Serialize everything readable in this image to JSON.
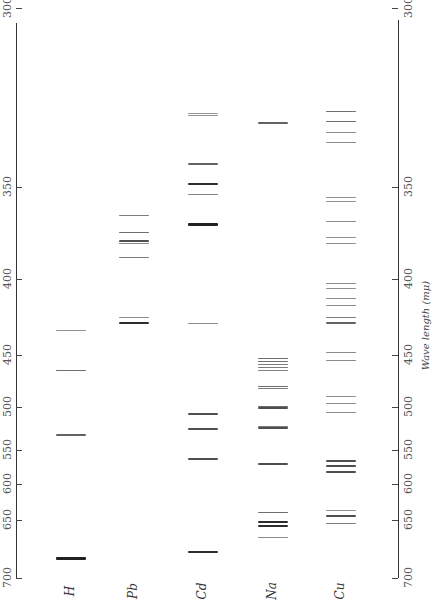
{
  "chart_data": {
    "type": "spectral-line-chart",
    "title": "",
    "axis_label": "Wave length (mμ)",
    "axis_ticks": [
      300,
      350,
      400,
      450,
      500,
      550,
      600,
      650,
      700
    ],
    "axis_tick_y": [
      8,
      187,
      279,
      355,
      407,
      450,
      484,
      520,
      578
    ],
    "orientation": "wavelength increases downward; labels rotated",
    "elements": [
      {
        "name": "H",
        "lines": [
          {
            "y": 330,
            "w": 0.5
          },
          {
            "y": 370,
            "w": 1
          },
          {
            "y": 435,
            "w": 1.2
          },
          {
            "y": 558,
            "w": 3
          }
        ]
      },
      {
        "name": "Pb",
        "lines": [
          {
            "y": 215,
            "w": 0.8
          },
          {
            "y": 232,
            "w": 1
          },
          {
            "y": 241,
            "w": 1.5
          },
          {
            "y": 243,
            "w": 0.6
          },
          {
            "y": 257,
            "w": 0.8
          },
          {
            "y": 317,
            "w": 0.6
          },
          {
            "y": 323,
            "w": 2
          }
        ]
      },
      {
        "name": "Cd",
        "lines": [
          {
            "y": 113,
            "w": 0.4
          },
          {
            "y": 115,
            "w": 0.4
          },
          {
            "y": 164,
            "w": 1.2
          },
          {
            "y": 184,
            "w": 2
          },
          {
            "y": 194,
            "w": 0.7
          },
          {
            "y": 224,
            "w": 3
          },
          {
            "y": 323,
            "w": 0.6
          },
          {
            "y": 414,
            "w": 1.5
          },
          {
            "y": 429,
            "w": 1.5
          },
          {
            "y": 459,
            "w": 1.5
          },
          {
            "y": 552,
            "w": 2
          }
        ]
      },
      {
        "name": "Na",
        "lines": [
          {
            "y": 123,
            "w": 1.2
          },
          {
            "y": 358,
            "w": 1
          },
          {
            "y": 361,
            "w": 1
          },
          {
            "y": 364,
            "w": 0.8
          },
          {
            "y": 367,
            "w": 0.8
          },
          {
            "y": 370,
            "w": 0.7
          },
          {
            "y": 386,
            "w": 1
          },
          {
            "y": 388,
            "w": 0.8
          },
          {
            "y": 406,
            "w": 1
          },
          {
            "y": 408,
            "w": 1.5
          },
          {
            "y": 426,
            "w": 0.8
          },
          {
            "y": 428,
            "w": 1.5
          },
          {
            "y": 464,
            "w": 1.5
          },
          {
            "y": 512,
            "w": 1
          },
          {
            "y": 522,
            "w": 2
          },
          {
            "y": 526,
            "w": 2
          },
          {
            "y": 537,
            "w": 0.6
          }
        ]
      },
      {
        "name": "Cu",
        "lines": [
          {
            "y": 111,
            "w": 1
          },
          {
            "y": 121,
            "w": 1
          },
          {
            "y": 132,
            "w": 0.6
          },
          {
            "y": 142,
            "w": 0.6
          },
          {
            "y": 197,
            "w": 0.5
          },
          {
            "y": 201,
            "w": 0.5
          },
          {
            "y": 221,
            "w": 0.6
          },
          {
            "y": 237,
            "w": 0.5
          },
          {
            "y": 243,
            "w": 0.5
          },
          {
            "y": 283,
            "w": 0.6
          },
          {
            "y": 288,
            "w": 0.5
          },
          {
            "y": 298,
            "w": 0.6
          },
          {
            "y": 305,
            "w": 0.6
          },
          {
            "y": 317,
            "w": 0.8
          },
          {
            "y": 323,
            "w": 1.2
          },
          {
            "y": 352,
            "w": 0.6
          },
          {
            "y": 360,
            "w": 0.6
          },
          {
            "y": 396,
            "w": 0.5
          },
          {
            "y": 403,
            "w": 0.6
          },
          {
            "y": 412,
            "w": 0.6
          },
          {
            "y": 461,
            "w": 1.5
          },
          {
            "y": 466,
            "w": 1.5
          },
          {
            "y": 472,
            "w": 1.5
          },
          {
            "y": 510,
            "w": 0.5
          },
          {
            "y": 516,
            "w": 1.5
          },
          {
            "y": 523,
            "w": 0.8
          }
        ]
      }
    ]
  },
  "left_axis": {
    "ticks": [
      "300",
      "350",
      "400",
      "450",
      "500",
      "550",
      "600",
      "650",
      "700"
    ]
  },
  "right_axis": {
    "ticks": [
      "300",
      "350",
      "400",
      "450",
      "500",
      "550",
      "600",
      "650",
      "700"
    ],
    "title": "Wave length (mμ)"
  },
  "element_labels": [
    "H",
    "Pb",
    "Cd",
    "Na",
    "Cu"
  ]
}
